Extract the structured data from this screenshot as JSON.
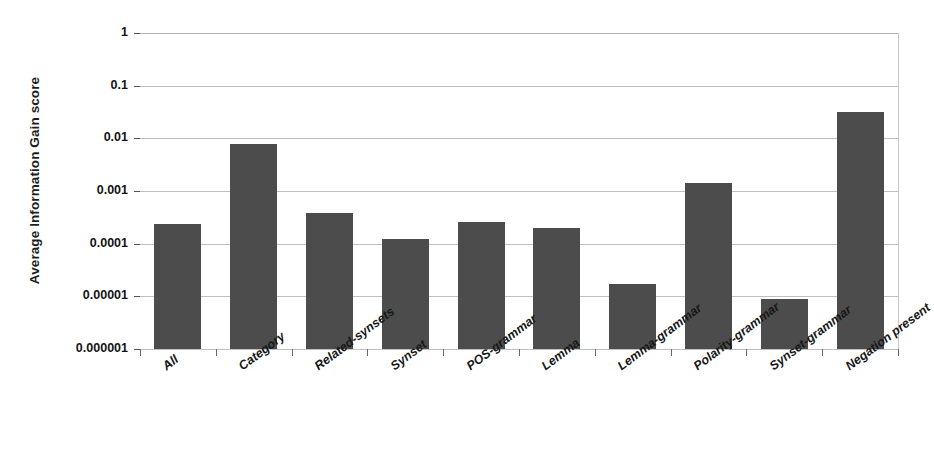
{
  "chart_data": {
    "type": "bar",
    "title": "",
    "xlabel": "",
    "ylabel": "Average Information Gain score",
    "yscale": "log",
    "ylim": [
      1e-06,
      1
    ],
    "ytick_labels": [
      "1",
      "0.1",
      "0.01",
      "0.001",
      "0.0001",
      "0.00001",
      "0.000001"
    ],
    "ytick_values": [
      1,
      0.1,
      0.01,
      0.001,
      0.0001,
      1e-05,
      1e-06
    ],
    "grid": true,
    "legend": "none",
    "bar_color": "#4c4c4c",
    "categories": [
      "All",
      "Category",
      "Related-synsets",
      "Synset",
      "POS-grammar",
      "Lemma",
      "Lemma-grammar",
      "Polarity-grammar",
      "Synset-grammar",
      "Negation present"
    ],
    "values": [
      0.00024,
      0.0078,
      0.00038,
      0.000122,
      0.00026,
      0.0002,
      1.68e-05,
      0.00145,
      8.8e-06,
      0.031
    ]
  }
}
